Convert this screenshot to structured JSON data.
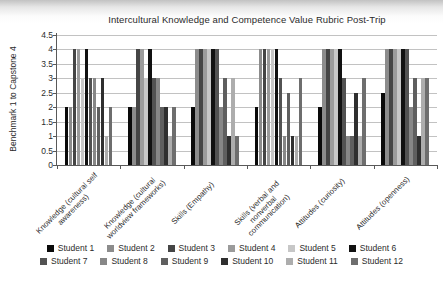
{
  "chart_data": {
    "type": "bar",
    "title": "Intercultural Knowledge and Competence Value Rubric Post-Trip",
    "ylabel": "Benchmark 1 to Capstone 4",
    "xlabel": "",
    "ylim": [
      0,
      4.5
    ],
    "ytick_step": 0.5,
    "grid": true,
    "legend_position": "bottom",
    "legend_rows": 2,
    "categories": [
      "Knowledge (cultural self awareness)",
      "Knowledge (cultural worldview frameworks)",
      "Skills (Empathy)",
      "Skills (verbal and nonverbal communication)",
      "Attitudes (curiosity)",
      "Attitudes (openness)"
    ],
    "series": [
      {
        "name": "Student 1",
        "color": "#0a0a0a",
        "values": [
          2,
          2,
          2,
          2,
          2,
          2.5
        ]
      },
      {
        "name": "Student 2",
        "color": "#8c8c8c",
        "values": [
          2,
          2,
          4,
          4,
          4,
          4
        ]
      },
      {
        "name": "Student 3",
        "color": "#454545",
        "values": [
          4,
          4,
          4,
          4,
          4,
          4
        ]
      },
      {
        "name": "Student 4",
        "color": "#9b9b9b",
        "values": [
          4,
          4,
          4,
          4,
          4,
          4
        ]
      },
      {
        "name": "Student 5",
        "color": "#c7c7c7",
        "values": [
          3,
          3,
          4,
          4,
          4,
          4
        ]
      },
      {
        "name": "Student 6",
        "color": "#111111",
        "values": [
          4,
          4,
          4,
          4,
          4,
          4
        ]
      },
      {
        "name": "Student 7",
        "color": "#525252",
        "values": [
          3,
          3,
          4,
          3,
          3,
          4
        ]
      },
      {
        "name": "Student 8",
        "color": "#878787",
        "values": [
          3,
          3,
          2,
          1,
          1,
          2
        ]
      },
      {
        "name": "Student 9",
        "color": "#5f5f5f",
        "values": [
          2,
          2,
          3,
          2.5,
          1,
          3
        ]
      },
      {
        "name": "Student 10",
        "color": "#2f2f2f",
        "values": [
          3,
          2,
          1,
          1,
          2.5,
          1
        ]
      },
      {
        "name": "Student 11",
        "color": "#adadad",
        "values": [
          1,
          1,
          3,
          1,
          1,
          3
        ]
      },
      {
        "name": "Student 12",
        "color": "#6e6e6e",
        "values": [
          2,
          2,
          1,
          3,
          3,
          3
        ]
      }
    ]
  }
}
